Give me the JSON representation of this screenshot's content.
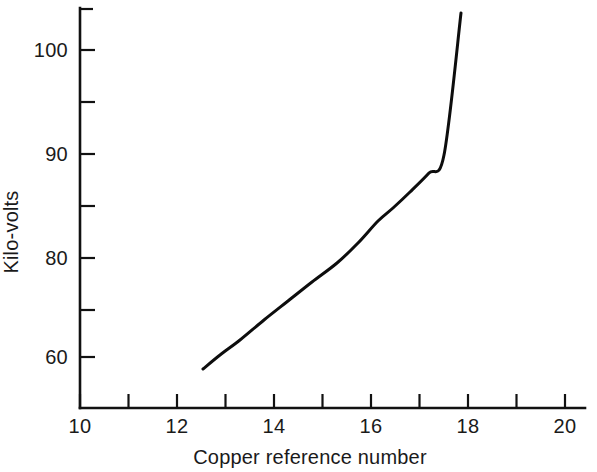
{
  "figure": {
    "background_color": "#ffffff",
    "ink_color": "#111111"
  },
  "chart_data": {
    "type": "line",
    "title": "",
    "subtitle": "",
    "xlabel": "Copper reference number",
    "ylabel": "Kilo-volts",
    "xlim": [
      10,
      20
    ],
    "ylim": [
      56,
      106
    ],
    "grid": false,
    "legend": null,
    "x_major_labels": [
      "10",
      "12",
      "14",
      "16",
      "18",
      "20"
    ],
    "x_major_values": [
      10,
      12,
      14,
      16,
      18,
      20
    ],
    "x_minor_values": [
      11,
      13,
      15,
      17,
      19
    ],
    "x_tick_step": 1,
    "y_major_labels": [
      "60",
      "80",
      "90",
      "100"
    ],
    "y_major_label_pixel_y": [
      357,
      258,
      154,
      50
    ],
    "y_minor_label_pixel_y": [
      310,
      206,
      102
    ],
    "annotations": [],
    "series": [
      {
        "name": "Kilo-volts",
        "color": "#0d0d0d",
        "x": [
          12.55,
          12.9,
          13.3,
          13.8,
          14.3,
          14.8,
          15.3,
          15.75,
          16.15,
          16.45,
          16.8,
          17.2,
          17.5,
          17.75
        ],
        "y": [
          58.8,
          61.5,
          64.4,
          68.2,
          72.0,
          75.6,
          79.4,
          83.3,
          87.4,
          89.9,
          93.0,
          96.6,
          100.2,
          104.5
        ],
        "pixel_points": [
          [
            203,
            369
          ],
          [
            220,
            355
          ],
          [
            240,
            340
          ],
          [
            264,
            320
          ],
          [
            288,
            301
          ],
          [
            312,
            282
          ],
          [
            337,
            263
          ],
          [
            358,
            243
          ],
          [
            378,
            221
          ],
          [
            393,
            208
          ],
          [
            410,
            192
          ],
          [
            429,
            173
          ],
          [
            444,
            155
          ],
          [
            461,
            13
          ]
        ]
      }
    ]
  },
  "axes_geometry": {
    "origin_px": [
      80,
      408
    ],
    "x_axis_end_px": [
      585,
      408
    ],
    "y_axis_top_px": [
      80,
      8
    ],
    "x_units_per_pixel": 48.5,
    "y_pixels_per_10_units": 104
  }
}
